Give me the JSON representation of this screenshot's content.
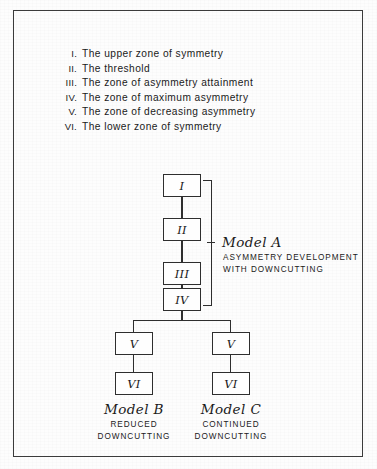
{
  "figure": {
    "legend": [
      {
        "numeral": "I.",
        "text": "The upper zone  of symmetry"
      },
      {
        "numeral": "II.",
        "text": "The  threshold"
      },
      {
        "numeral": "III.",
        "text": "The  zone of asymmetry attainment"
      },
      {
        "numeral": "IV.",
        "text": "The  zone of maximum  asymmetry"
      },
      {
        "numeral": "V.",
        "text": "The  zone of decreasing  asymmetry"
      },
      {
        "numeral": "VI.",
        "text": "The  lower zone  of symmetry"
      }
    ],
    "nodes": {
      "trunk": [
        "I",
        "II",
        "III",
        "IV"
      ],
      "branch_left": [
        "V",
        "VI"
      ],
      "branch_right": [
        "V",
        "VI"
      ]
    },
    "annotations": {
      "model_a": {
        "title": "Model A",
        "sub_line1": "ASYMMETRY DEVELOPMENT",
        "sub_line2": "WITH DOWNCUTTING"
      },
      "model_b": {
        "title": "Model B",
        "sub_line1": "REDUCED",
        "sub_line2": "DOWNCUTTING"
      },
      "model_c": {
        "title": "Model C",
        "sub_line1": "CONTINUED",
        "sub_line2": "DOWNCUTTING"
      }
    },
    "colors": {
      "ink": "#2e2e2e",
      "frame": "#3b3b3b",
      "paper": "#fdfdfd"
    }
  }
}
